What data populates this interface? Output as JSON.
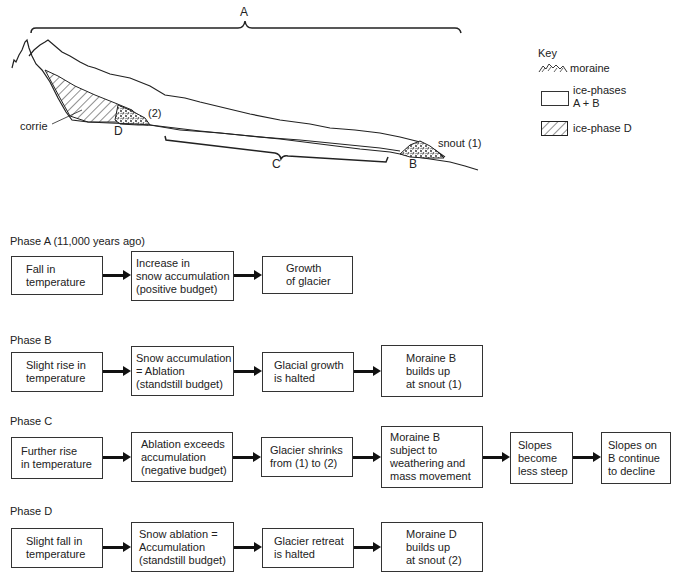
{
  "diagram": {
    "labels": {
      "A": "A",
      "B": "B",
      "C": "C",
      "D": "D",
      "corrie": "corrie",
      "snout1": "snout (1)",
      "pos2": "(2)"
    }
  },
  "key": {
    "title": "Key",
    "items": [
      {
        "icon": "moraine-stipple-icon",
        "label": "moraine"
      },
      {
        "icon": "empty-box-icon",
        "label": "ice-phases\nA + B"
      },
      {
        "icon": "hatched-box-icon",
        "label": "ice-phase D"
      }
    ]
  },
  "phases": [
    {
      "title": "Phase A (11,000 years ago)",
      "steps": [
        "Fall in\ntemperature",
        "Increase in\nsnow accumulation\n(positive budget)",
        "Growth\nof glacier"
      ]
    },
    {
      "title": "Phase B",
      "steps": [
        "Slight rise in\ntemperature",
        "Snow accumulation\n= Ablation\n(standstill budget)",
        "Glacial growth\nis halted",
        "Moraine B\nbuilds up\nat snout (1)"
      ]
    },
    {
      "title": "Phase C",
      "steps": [
        "Further rise\nin temperature",
        "Ablation exceeds\naccumulation\n(negative budget)",
        "Glacier shrinks\nfrom (1) to (2)",
        "Moraine B\nsubject to\nweathering and\nmass movement",
        "Slopes\nbecome\nless steep",
        "Slopes on\nB continue\nto decline"
      ]
    },
    {
      "title": "Phase D",
      "steps": [
        "Slight fall in\ntemperature",
        "Snow ablation =\nAccumulation\n(standstill budget)",
        "Glacier retreat\nis halted",
        "Moraine D\nbuilds up\nat snout (2)"
      ]
    }
  ]
}
